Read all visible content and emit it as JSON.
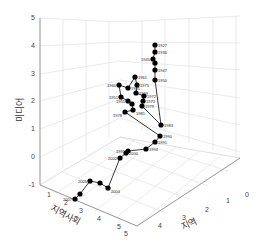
{
  "chart_data": {
    "type": "line3d",
    "title": "",
    "xlabel": "지역",
    "ylabel": "지역사회",
    "zlabel": "미디어",
    "x_ticks": [
      "0",
      "1",
      "2",
      "3",
      "4",
      "5"
    ],
    "y_ticks": [
      "1",
      "2",
      "3",
      "4",
      "5"
    ],
    "z_ticks": [
      "-1",
      "0",
      "1",
      "2",
      "3",
      "4",
      "5"
    ],
    "zlim": [
      -1,
      5
    ],
    "grid": true,
    "points": [
      {
        "year": "1927",
        "px": [
          155,
          45
        ]
      },
      {
        "year": "1936",
        "px": [
          155,
          52
        ]
      },
      {
        "year": "1945",
        "px": [
          153,
          59
        ]
      },
      {
        "year": "1945b",
        "px": [
          155,
          63
        ]
      },
      {
        "year": "1947",
        "px": [
          155,
          70
        ]
      },
      {
        "year": "1950",
        "px": [
          155,
          80
        ]
      },
      {
        "year": "1983",
        "px": [
          161,
          125
        ]
      },
      {
        "year": "1979",
        "px": [
          142,
          106
        ]
      },
      {
        "year": "1970",
        "px": [
          143,
          101
        ]
      },
      {
        "year": "1972",
        "px": [
          144,
          96
        ]
      },
      {
        "year": "1969",
        "px": [
          136,
          93
        ]
      },
      {
        "year": "1975",
        "px": [
          137,
          85
        ]
      },
      {
        "year": "1961",
        "px": [
          135,
          77
        ]
      },
      {
        "year": "1965",
        "px": [
          128,
          88
        ]
      },
      {
        "year": "1960",
        "px": [
          119,
          85
        ]
      },
      {
        "year": "1951",
        "px": [
          121,
          97
        ]
      },
      {
        "year": "1955",
        "px": [
          128,
          101
        ]
      },
      {
        "year": "1963",
        "px": [
          132,
          104
        ]
      },
      {
        "year": "1981",
        "px": [
          133,
          110
        ]
      },
      {
        "year": "1978",
        "px": [
          125,
          112
        ]
      },
      {
        "year": "1990",
        "px": [
          160,
          136
        ]
      },
      {
        "year": "1991",
        "px": [
          155,
          142
        ]
      },
      {
        "year": "1994",
        "px": [
          146,
          149
        ]
      },
      {
        "year": "1995",
        "px": [
          128,
          151
        ]
      },
      {
        "year": "2000",
        "px": [
          126,
          153
        ]
      },
      {
        "year": "2002",
        "px": [
          120,
          158
        ]
      },
      {
        "year": "2004",
        "px": [
          108,
          188
        ]
      },
      {
        "year": "2003",
        "px": [
          100,
          183
        ]
      },
      {
        "year": "2005",
        "px": [
          90,
          181
        ]
      },
      {
        "year": "2006",
        "px": [
          80,
          194
        ]
      },
      {
        "year": "2007",
        "px": [
          75,
          199
        ]
      }
    ],
    "visible_labels": [
      "1927",
      "1936",
      "1945",
      "1947",
      "1950",
      "1961",
      "1975",
      "1960",
      "1965",
      "1951",
      "1969",
      "1972",
      "1970",
      "1979",
      "1955",
      "1978",
      "1981",
      "1983",
      "1990",
      "1991",
      "1994",
      "1995",
      "2000",
      "2002",
      "2004",
      "2005",
      "2007"
    ]
  }
}
